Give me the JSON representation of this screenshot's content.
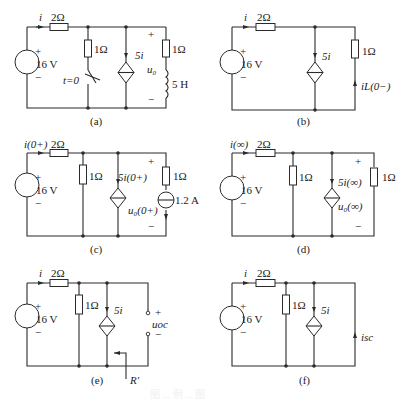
{
  "figure": {
    "caption_faint": "图 ... 例 ... 图",
    "panels": [
      {
        "id": "a",
        "caption": "(a)",
        "labels": {
          "current": "i",
          "series_resistor": "2Ω",
          "source_plus": "+",
          "source_value": "16 V",
          "source_minus": "−",
          "shunt_resistor": "1Ω",
          "switch": "t=0",
          "dep_source": "5i",
          "out_plus": "+",
          "out_voltage": "u₀",
          "out_minus": "−",
          "load_resistor": "1Ω",
          "inductor": "5 H"
        }
      },
      {
        "id": "b",
        "caption": "(b)",
        "labels": {
          "current": "i",
          "series_resistor": "2Ω",
          "source_plus": "+",
          "source_value": "16 V",
          "source_minus": "−",
          "dep_source": "5i",
          "load_resistor": "1Ω",
          "inductor_current": "iL(0−)"
        }
      },
      {
        "id": "c",
        "caption": "(c)",
        "labels": {
          "current": "i(0+)",
          "series_resistor": "2Ω",
          "source_plus": "+",
          "source_value": "16 V",
          "source_minus": "−",
          "shunt_resistor": "1Ω",
          "dep_source": "5i(0+)",
          "out_plus": "+",
          "out_voltage": "u₀(0+)",
          "out_minus": "−",
          "load_resistor": "1Ω",
          "current_source": "1.2 A"
        }
      },
      {
        "id": "d",
        "caption": "(d)",
        "labels": {
          "current": "i(∞)",
          "series_resistor": "2Ω",
          "source_plus": "+",
          "source_value": "16 V",
          "source_minus": "−",
          "shunt_resistor": "1Ω",
          "dep_source": "5i(∞)",
          "out_plus": "+",
          "out_voltage": "u₀(∞)",
          "out_minus": "−",
          "load_resistor": "1Ω"
        }
      },
      {
        "id": "e",
        "caption": "(e)",
        "labels": {
          "current": "i",
          "series_resistor": "2Ω",
          "source_plus": "+",
          "source_value": "16 V",
          "source_minus": "−",
          "shunt_resistor": "1Ω",
          "dep_source": "5i",
          "oc_plus": "+",
          "oc_voltage": "uoc",
          "oc_minus": "−",
          "equivalent_resistance": "R′"
        }
      },
      {
        "id": "f",
        "caption": "(f)",
        "labels": {
          "current": "i",
          "series_resistor": "2Ω",
          "source_plus": "+",
          "source_value": "16 V",
          "source_minus": "−",
          "shunt_resistor": "1Ω",
          "dep_source": "5i",
          "sc_current": "isc"
        }
      }
    ]
  }
}
